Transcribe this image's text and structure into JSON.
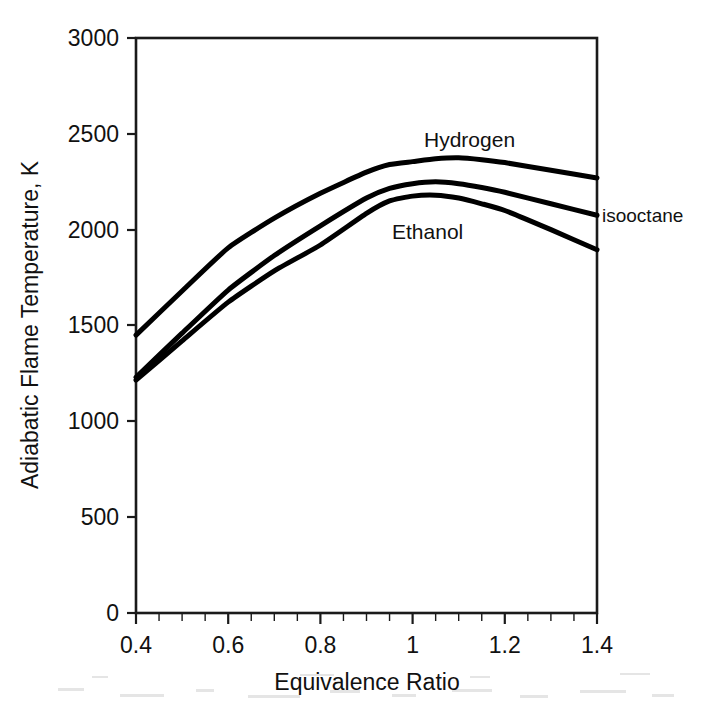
{
  "chart_data": {
    "type": "line",
    "title": "",
    "xlabel": "Equivalence Ratio",
    "ylabel": "Adiabatic Flame Temperature, K",
    "xlim": [
      0.4,
      1.4
    ],
    "ylim": [
      0,
      3000
    ],
    "xticks": [
      0.4,
      0.6,
      0.8,
      1,
      1.2,
      1.4
    ],
    "xtick_labels": [
      "0.4",
      "0.6",
      "0.8",
      "1",
      "1.2",
      "1.4"
    ],
    "yticks": [
      0,
      500,
      1000,
      1500,
      2000,
      2500,
      3000
    ],
    "ytick_labels": [
      "0",
      "500",
      "1000",
      "1500",
      "2000",
      "2500",
      "3000"
    ],
    "minor_xtick_step": 0.05,
    "grid": false,
    "legend_position": "inline-annotations",
    "line_color": "#000000",
    "frame_color": "#1a1a1a",
    "background": "#ffffff",
    "x": [
      0.4,
      0.5,
      0.6,
      0.7,
      0.8,
      0.9,
      0.95,
      1.0,
      1.05,
      1.1,
      1.15,
      1.2,
      1.3,
      1.4
    ],
    "series": [
      {
        "name": "Hydrogen",
        "label": "Hydrogen",
        "label_x": 1.03,
        "label_y": 2480,
        "values": [
          1450,
          1680,
          1905,
          2060,
          2190,
          2300,
          2340,
          2355,
          2370,
          2375,
          2365,
          2350,
          2310,
          2270
        ]
      },
      {
        "name": "isooctane",
        "label": "isooctane",
        "label_x": 1.43,
        "label_y": 2060,
        "values": [
          1230,
          1460,
          1685,
          1865,
          2020,
          2165,
          2215,
          2240,
          2250,
          2240,
          2220,
          2195,
          2135,
          2075
        ]
      },
      {
        "name": "Ethanol",
        "label": "Ethanol",
        "label_x": 0.93,
        "label_y": 2035,
        "values": [
          1215,
          1420,
          1622,
          1785,
          1920,
          2085,
          2150,
          2175,
          2180,
          2165,
          2135,
          2100,
          2000,
          1895
        ]
      }
    ]
  },
  "axes": {
    "x_axis_title": "Equivalence Ratio",
    "y_axis_title": "Adiabatic Flame Temperature, K"
  },
  "annotations": {
    "hydrogen_label": "Hydrogen",
    "isooctane_label": "isooctane",
    "ethanol_label": "Ethanol"
  }
}
